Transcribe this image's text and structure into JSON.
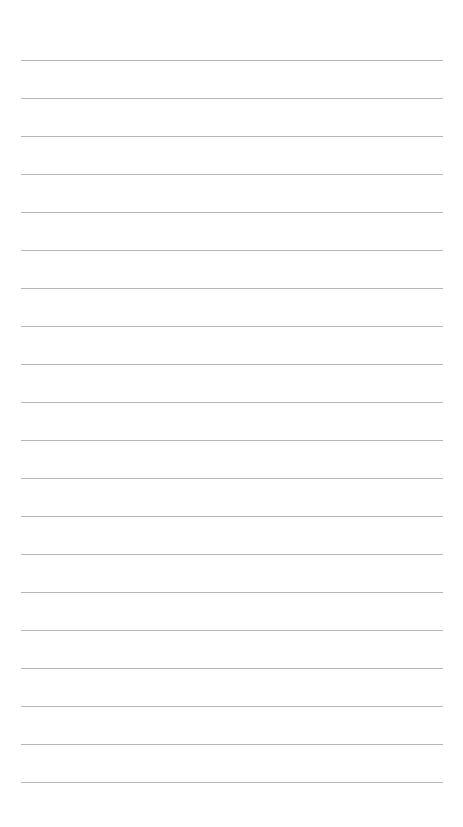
{
  "page": {
    "type": "lined-paper",
    "background_color": "#ffffff",
    "line_color": "#a9a9a9",
    "line_count": 20,
    "first_line_y": 60,
    "line_spacing": 38,
    "line_left": 21,
    "line_right": 443,
    "lines": [
      {
        "text": ""
      },
      {
        "text": ""
      },
      {
        "text": ""
      },
      {
        "text": ""
      },
      {
        "text": ""
      },
      {
        "text": ""
      },
      {
        "text": ""
      },
      {
        "text": ""
      },
      {
        "text": ""
      },
      {
        "text": ""
      },
      {
        "text": ""
      },
      {
        "text": ""
      },
      {
        "text": ""
      },
      {
        "text": ""
      },
      {
        "text": ""
      },
      {
        "text": ""
      },
      {
        "text": ""
      },
      {
        "text": ""
      },
      {
        "text": ""
      },
      {
        "text": ""
      }
    ]
  }
}
